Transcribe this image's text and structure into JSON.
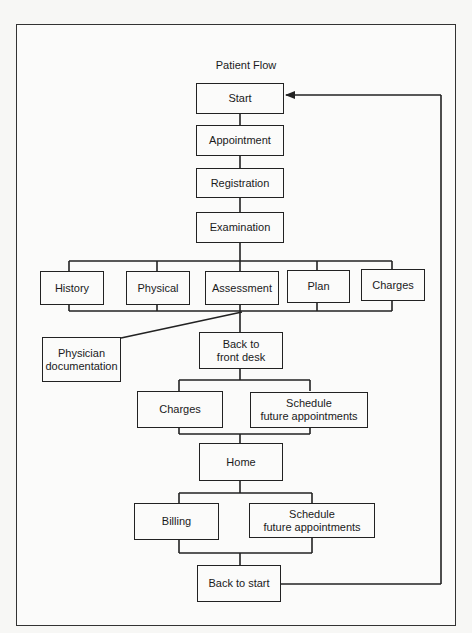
{
  "header": {
    "running_text": ""
  },
  "diagram": {
    "title": "Patient Flow",
    "nodes": {
      "start": "Start",
      "appointment": "Appointment",
      "registration": "Registration",
      "examination": "Examination",
      "history": "History",
      "physical": "Physical",
      "assessment": "Assessment",
      "plan": "Plan",
      "exam_charges": "Charges",
      "physician_documentation": "Physician\ndocumentation",
      "back_to_front_desk": "Back to\nfront desk",
      "front_desk_charges": "Charges",
      "schedule_future_1": "Schedule\nfuture appointments",
      "home": "Home",
      "billing": "Billing",
      "schedule_future_2": "Schedule\nfuture appointments",
      "back_to_start": "Back to start"
    },
    "edges": [
      [
        "Start",
        "Appointment"
      ],
      [
        "Appointment",
        "Registration"
      ],
      [
        "Registration",
        "Examination"
      ],
      [
        "Examination",
        "History"
      ],
      [
        "Examination",
        "Physical"
      ],
      [
        "Examination",
        "Assessment"
      ],
      [
        "Examination",
        "Plan"
      ],
      [
        "Examination",
        "Charges"
      ],
      [
        "History/Physical/Assessment/Plan/Charges",
        "Physician documentation"
      ],
      [
        "History/Physical/Assessment/Plan/Charges",
        "Back to front desk"
      ],
      [
        "Back to front desk",
        "Charges"
      ],
      [
        "Back to front desk",
        "Schedule future appointments"
      ],
      [
        "Charges/Schedule future appointments",
        "Home"
      ],
      [
        "Home",
        "Billing"
      ],
      [
        "Home",
        "Schedule future appointments"
      ],
      [
        "Billing/Schedule future appointments",
        "Back to start"
      ],
      [
        "Back to start",
        "Start"
      ]
    ],
    "line_color": "#222222",
    "background_color": "#fbfbfa"
  }
}
